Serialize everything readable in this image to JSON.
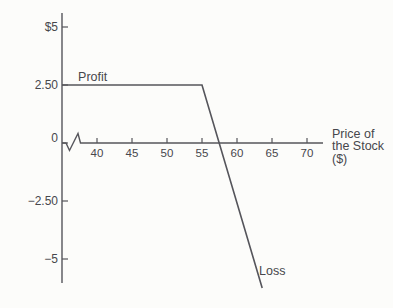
{
  "figure": {
    "background": "#fcfcfa",
    "line_color": "#55555b",
    "text_color": "#47474c"
  },
  "chart_data": {
    "type": "line",
    "title": "",
    "xlabel_lines": [
      "Price of",
      "the Stock",
      "($)"
    ],
    "ylabel": "",
    "x_ticks": [
      {
        "label": "40",
        "value": 40
      },
      {
        "label": "45",
        "value": 45
      },
      {
        "label": "50",
        "value": 50
      },
      {
        "label": "55",
        "value": 55
      },
      {
        "label": "60",
        "value": 60
      },
      {
        "label": "65",
        "value": 65
      },
      {
        "label": "70",
        "value": 70
      }
    ],
    "y_ticks": [
      {
        "label": "$5",
        "value": 5,
        "dy": 0
      },
      {
        "label": "2.50",
        "value": 2.5,
        "dy": 0
      },
      {
        "label": "0",
        "value": 0,
        "dy": -5
      },
      {
        "label": "−2.50",
        "value": -2.5,
        "dy": 0
      },
      {
        "label": "−5",
        "value": -5,
        "dy": 0
      }
    ],
    "axis_break_on_x": true,
    "x_range_shown": [
      35,
      72.3
    ],
    "y_range_shown": [
      -6.5,
      5.6
    ],
    "grid": false,
    "legend": "none",
    "series": [
      {
        "name": "option-payoff",
        "points": [
          [
            35,
            2.5
          ],
          [
            55,
            2.5
          ],
          [
            63.6,
            -6.25
          ]
        ]
      }
    ],
    "annotations": [
      {
        "text": "Profit",
        "x": 37.3,
        "y": 2.67,
        "anchor": "start"
      },
      {
        "text": "Loss",
        "x": 63.15,
        "y": -5.69,
        "anchor": "start"
      }
    ]
  }
}
